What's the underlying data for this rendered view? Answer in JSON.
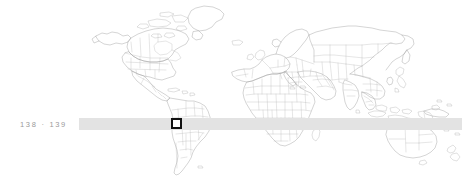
{
  "page": {
    "width": 471,
    "height": 181,
    "background_color": "#ffffff"
  },
  "folio": {
    "text": "138 · 139",
    "left_page_number": "138",
    "separator": "·",
    "right_page_number": "139",
    "color": "#9a9a9a"
  },
  "tint_band": {
    "color": "#e3e3e3",
    "label": "horizontal-highlight-band"
  },
  "map": {
    "title": "world-map",
    "projection": "equirectangular",
    "land_stroke_color": "#9b9b9b",
    "border_stroke_color": "#b4b4b4",
    "fill_color": "none",
    "regions": [
      "North America",
      "South America",
      "Europe",
      "Africa",
      "Asia",
      "Australia",
      "New Zealand",
      "Greenland",
      "Japan",
      "Indonesia",
      "Madagascar",
      "British Isles",
      "Iceland"
    ]
  },
  "marker": {
    "name": "location-marker",
    "shape": "hollow-square",
    "outline_color": "#111111",
    "fill_color": "#ffffff",
    "region": "South America",
    "approx_location": "Peru / Bolivia"
  }
}
